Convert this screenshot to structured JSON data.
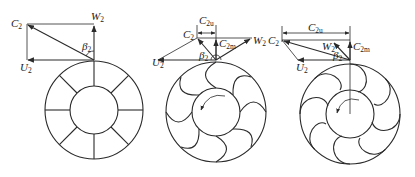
{
  "figure": {
    "panels": [
      {
        "id": "radial",
        "blade_type": "radial blades (beta2 = 90°)",
        "labels": {
          "c2": "C",
          "c2_sub": "2",
          "w2": "W",
          "w2_sub": "2",
          "u2": "U",
          "u2_sub": "2",
          "beta": "β",
          "beta_sub": "2"
        }
      },
      {
        "id": "forward",
        "blade_type": "forward-curved blades (beta2 > 90°)",
        "labels": {
          "c2": "C",
          "c2_sub": "2",
          "w2": "W",
          "w2_sub": "2",
          "u2": "U",
          "u2_sub": "2",
          "beta": "β",
          "beta_sub": "2",
          "c2u": "C",
          "c2u_sub": "2u",
          "c2m": "C",
          "c2m_sub": "2m"
        }
      },
      {
        "id": "strong-forward",
        "blade_type": "strongly forward-curved blades",
        "labels": {
          "c2": "C",
          "c2_sub": "2",
          "w2": "W",
          "w2_sub": "2",
          "u2": "U",
          "u2_sub": "2",
          "beta": "β",
          "beta_sub": "2",
          "c2u": "C",
          "c2u_sub": "2u",
          "c2m": "C",
          "c2m_sub": "2m"
        }
      }
    ],
    "colors": {
      "line": "#2a2a2a",
      "background": "#ffffff"
    }
  }
}
